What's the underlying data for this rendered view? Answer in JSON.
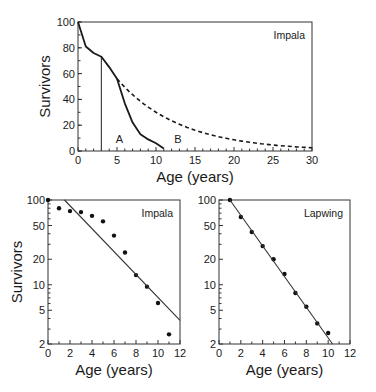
{
  "chart_data": [
    {
      "id": "top",
      "type": "line",
      "title": "",
      "annotation": "Impala",
      "xlabel": "Age (years)",
      "ylabel": "Survivors",
      "xlim": [
        0,
        30
      ],
      "ylim": [
        0,
        100
      ],
      "yscale": "linear",
      "xticks": [
        0,
        5,
        10,
        15,
        20,
        25,
        30
      ],
      "yticks": [
        0,
        20,
        40,
        60,
        80,
        100
      ],
      "grid": false,
      "series": [
        {
          "name": "A (observed survivorship)",
          "style": "solid",
          "x": [
            0,
            1,
            2,
            3,
            4,
            5,
            6,
            7,
            8,
            9,
            10,
            11
          ],
          "y": [
            100,
            81,
            76,
            73,
            65,
            56,
            37,
            22,
            13,
            9,
            6,
            2
          ]
        },
        {
          "name": "B (constant mortality projection)",
          "style": "dashed",
          "x": [
            5,
            7.5,
            10,
            12.5,
            15,
            17.5,
            20,
            22.5,
            25,
            27.5,
            30
          ],
          "y": [
            56,
            41,
            30,
            22,
            16,
            12,
            9,
            6.5,
            4.8,
            3.5,
            2.5
          ]
        }
      ],
      "vertical_marker": {
        "x": 3,
        "y_from": 0,
        "y_to": 73
      },
      "region_labels": [
        {
          "text": "A",
          "x": 5.3,
          "y": 9
        },
        {
          "text": "B",
          "x": 12.8,
          "y": 9
        }
      ]
    },
    {
      "id": "bottom-left",
      "type": "scatter",
      "title": "",
      "annotation": "Impala",
      "xlabel": "Age (years)",
      "ylabel": "Survivors",
      "xlim": [
        0,
        12
      ],
      "ylim": [
        2,
        100
      ],
      "yscale": "log",
      "xticks": [
        0,
        2,
        4,
        6,
        8,
        10,
        12
      ],
      "yticks": [
        2,
        5,
        10,
        20,
        50,
        100
      ],
      "grid": false,
      "series": [
        {
          "name": "Observed survivors",
          "x": [
            0,
            1,
            2,
            3,
            4,
            5,
            6,
            7,
            8,
            9,
            10,
            11
          ],
          "y": [
            100,
            80,
            74,
            72,
            65,
            56,
            38,
            24,
            13,
            9.5,
            6.1,
            2.6
          ]
        }
      ],
      "fit_line": {
        "x": [
          1.5,
          12
        ],
        "y": [
          100,
          3.8
        ]
      }
    },
    {
      "id": "bottom-right",
      "type": "scatter",
      "title": "",
      "annotation": "Lapwing",
      "xlabel": "Age (years)",
      "ylabel": "",
      "xlim": [
        0,
        12
      ],
      "ylim": [
        2,
        100
      ],
      "yscale": "log",
      "xticks": [
        0,
        2,
        4,
        6,
        8,
        10,
        12
      ],
      "yticks": [
        2,
        5,
        10,
        20,
        50,
        100
      ],
      "grid": false,
      "series": [
        {
          "name": "Observed survivors",
          "x": [
            1,
            2,
            3,
            4,
            5,
            6,
            7,
            8,
            9,
            10
          ],
          "y": [
            100,
            63,
            42,
            28.6,
            20,
            13.4,
            8,
            5.5,
            3.5,
            2.7
          ]
        }
      ],
      "fit_line": {
        "x": [
          1,
          10.4
        ],
        "y": [
          100,
          2
        ]
      }
    }
  ],
  "layout": {
    "top": {
      "left": 78,
      "right": 312,
      "top": 22,
      "bottom": 151
    },
    "bottom-left": {
      "left": 48,
      "right": 180,
      "top": 200,
      "bottom": 344
    },
    "bottom-right": {
      "left": 219,
      "right": 350,
      "top": 200,
      "bottom": 344
    }
  }
}
